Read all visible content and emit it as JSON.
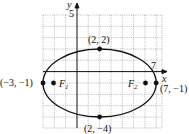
{
  "figure": {
    "type": "ellipse",
    "axes": {
      "x_label": "x",
      "y_label": "y",
      "x_tick": "7",
      "y_tick": "5"
    },
    "points": {
      "top": "(2, 2)",
      "bottom": "(2, −4)",
      "left": "(−3, −1)",
      "right": "(7, −1)"
    },
    "foci": {
      "f1": "F",
      "f1_sub": "1",
      "f2": "F",
      "f2_sub": "2"
    }
  }
}
